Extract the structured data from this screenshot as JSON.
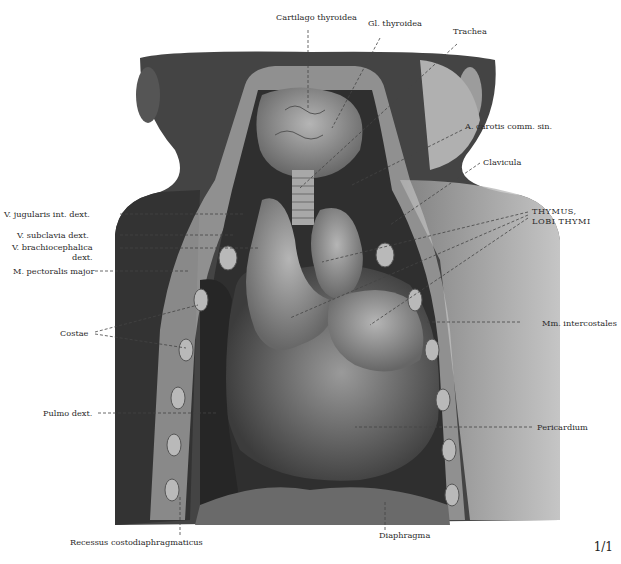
{
  "figure": {
    "type": "anatomical-illustration"
  },
  "labels": {
    "cartilago_thyroidea": "Cartilago thyroidea",
    "gl_thyroidea": "Gl. thyroidea",
    "trachea": "Trachea",
    "a_carotis": "A. carotis comm. sin.",
    "clavicula": "Clavicula",
    "thymus_line1": "THYMUS,",
    "thymus_line2": "LOBI THYMI",
    "v_jugularis": "V. jugularis int. dext.",
    "v_subclavia": "V. subclavia dext.",
    "v_brachio_line1": "V. brachiocephalica",
    "v_brachio_line2": "dext.",
    "m_pectoralis": "M. pectoralis major",
    "costae": "Costae",
    "mm_intercostales": "Mm. intercostales",
    "pulmo_dext": "Pulmo dext.",
    "pericardium": "Pericardium",
    "recessus": "Recessus costodiaphragmaticus",
    "diaphragma": "Diaphragma"
  },
  "page": {
    "number": "1/1"
  },
  "colors": {
    "background": "#ffffff",
    "ink": "#2a2a2a",
    "dark_tissue": "#3a3a3a",
    "mid_tissue": "#7a7a7a",
    "light_tissue": "#c8c8c8"
  }
}
